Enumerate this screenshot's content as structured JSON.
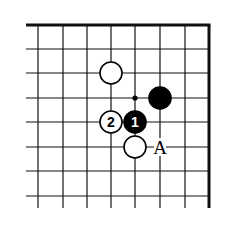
{
  "diagram": {
    "type": "go-board-corner",
    "corner": "top-right",
    "colors": {
      "background": "#ffffff",
      "line": "#111111",
      "black_stone": "#000000",
      "white_stone": "#ffffff"
    },
    "grid": {
      "x": [
        38,
        63,
        87,
        111,
        135,
        160,
        185,
        209
      ],
      "y": [
        25,
        49,
        73,
        98,
        122,
        147,
        171,
        196
      ],
      "left_extent": 26,
      "bottom_extent": 208,
      "edge_top_y": 25,
      "edge_right_x": 209
    },
    "stones": [
      {
        "color": "white",
        "cx": 111,
        "cy": 73,
        "label": ""
      },
      {
        "color": "black",
        "cx": 160,
        "cy": 98,
        "label": ""
      },
      {
        "color": "white",
        "cx": 111,
        "cy": 122,
        "label": "2"
      },
      {
        "color": "black",
        "cx": 135,
        "cy": 122,
        "label": "1"
      },
      {
        "color": "white",
        "cx": 135,
        "cy": 147,
        "label": ""
      }
    ],
    "markers": [
      {
        "type": "dot",
        "cx": 135,
        "cy": 98
      }
    ],
    "annotations": [
      {
        "text": "A",
        "cx": 160,
        "cy": 147
      }
    ]
  }
}
